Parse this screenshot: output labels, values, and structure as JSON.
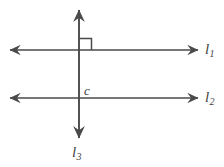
{
  "figure": {
    "background_color": "#ffffff",
    "stroke_color": "#4a4a4a",
    "label_color": "#3f3f3f",
    "width": 224,
    "height": 167
  },
  "labels": {
    "line1": {
      "base": "l",
      "sub": "1"
    },
    "line2": {
      "base": "l",
      "sub": "2"
    },
    "line3": {
      "base": "l",
      "sub": "3"
    },
    "point_c": {
      "base": "c",
      "sub": ""
    }
  },
  "geometry": {
    "lines": [
      {
        "name": "l1",
        "orientation": "horizontal",
        "y": 50,
        "x_start": 8,
        "x_end": 200,
        "arrows": "both"
      },
      {
        "name": "l2",
        "orientation": "horizontal",
        "y": 98,
        "x_start": 8,
        "x_end": 200,
        "arrows": "both"
      },
      {
        "name": "l3",
        "orientation": "vertical",
        "x": 79,
        "y_start": 8,
        "y_end": 140,
        "arrows": "both"
      }
    ],
    "intersections": [
      {
        "label": "",
        "x": 79,
        "y": 50,
        "right_angle": true
      },
      {
        "label": "c",
        "x": 79,
        "y": 98,
        "right_angle": false
      }
    ],
    "right_angle_marker": {
      "x": 79,
      "y": 50,
      "size": 12,
      "quadrant": "upper-right"
    }
  }
}
